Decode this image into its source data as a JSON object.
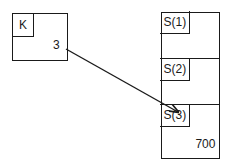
{
  "variable_k": {
    "name": "K",
    "value": "3"
  },
  "array_s": {
    "cells": [
      {
        "label": "S(1)",
        "value": ""
      },
      {
        "label": "S(2)",
        "value": ""
      },
      {
        "label": "S(3)",
        "value": "700"
      }
    ]
  },
  "arrow": {
    "from": "K",
    "to": "S(3)"
  }
}
